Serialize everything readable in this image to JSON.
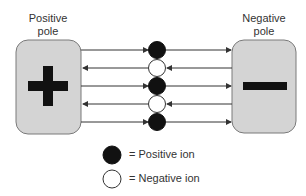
{
  "poles": {
    "positive": {
      "label_line1": "Positive",
      "label_line2": "pole",
      "symbol": "plus"
    },
    "negative": {
      "label_line1": "Negative",
      "label_line2": "pole",
      "symbol": "minus"
    }
  },
  "ions": [
    {
      "type": "positive",
      "arrow_direction": "to-negative"
    },
    {
      "type": "negative",
      "arrow_direction": "to-positive"
    },
    {
      "type": "positive",
      "arrow_direction": "to-negative"
    },
    {
      "type": "negative",
      "arrow_direction": "to-positive"
    },
    {
      "type": "positive",
      "arrow_direction": "to-negative"
    }
  ],
  "legend": [
    {
      "symbol": "filled-circle",
      "text": "= Positive ion"
    },
    {
      "symbol": "open-circle",
      "text": "= Negative ion"
    }
  ],
  "colors": {
    "pole_fill": "#d4d4d4",
    "pole_stroke": "#7a7a7a",
    "symbol": "#111111",
    "line": "#333333",
    "positive_ion": "#111111",
    "negative_ion": "#ffffff"
  }
}
